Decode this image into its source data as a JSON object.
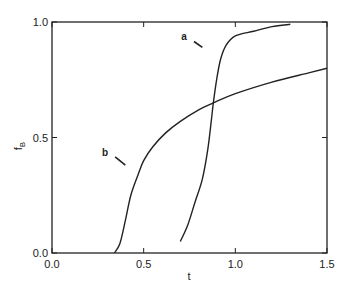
{
  "chart_data": {
    "type": "line",
    "title": "",
    "xlabel": "t",
    "ylabel": "f_B",
    "xlim": [
      0.0,
      1.5
    ],
    "ylim": [
      0.0,
      1.0
    ],
    "xticks": [
      0.0,
      0.5,
      1.0,
      1.5
    ],
    "xtick_labels": [
      "0.0",
      "0.5",
      "1.0",
      "1.5"
    ],
    "yticks": [
      0.0,
      0.5,
      1.0
    ],
    "ytick_labels": [
      "0.0",
      "0.5",
      "1.0"
    ],
    "grid": false,
    "legend": "none (curves labeled inline with arrows)",
    "series": [
      {
        "name": "a",
        "x": [
          0.7,
          0.74,
          0.78,
          0.82,
          0.85,
          0.87,
          0.88,
          0.9,
          0.92,
          0.95,
          1.0,
          1.1,
          1.2,
          1.3
        ],
        "y": [
          0.05,
          0.12,
          0.22,
          0.32,
          0.45,
          0.58,
          0.65,
          0.76,
          0.84,
          0.9,
          0.94,
          0.96,
          0.98,
          0.99
        ]
      },
      {
        "name": "b",
        "x": [
          0.34,
          0.37,
          0.4,
          0.43,
          0.47,
          0.5,
          0.55,
          0.62,
          0.7,
          0.8,
          0.88,
          1.0,
          1.2,
          1.4,
          1.5
        ],
        "y": [
          0.0,
          0.04,
          0.14,
          0.25,
          0.34,
          0.4,
          0.46,
          0.52,
          0.57,
          0.62,
          0.65,
          0.69,
          0.74,
          0.78,
          0.8
        ]
      }
    ],
    "annotations": [
      {
        "text": "a",
        "x": 0.72,
        "y": 0.92,
        "arrow_to": [
          0.82,
          0.89
        ]
      },
      {
        "text": "b",
        "x": 0.29,
        "y": 0.42,
        "arrow_to": [
          0.4,
          0.38
        ]
      }
    ]
  }
}
